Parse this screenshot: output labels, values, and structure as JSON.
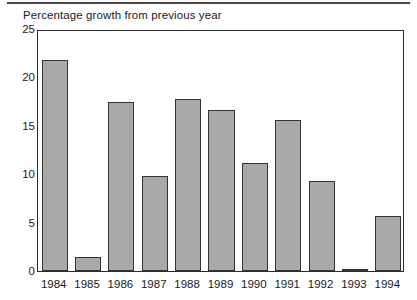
{
  "chart_data": {
    "type": "bar",
    "title": "Percentage growth from previous year",
    "xlabel": "",
    "ylabel": "",
    "categories": [
      "1984",
      "1985",
      "1986",
      "1987",
      "1988",
      "1989",
      "1990",
      "1991",
      "1992",
      "1993",
      "1994"
    ],
    "values": [
      21.8,
      1.4,
      17.5,
      9.8,
      17.8,
      16.6,
      11.2,
      15.6,
      9.3,
      0.2,
      5.7
    ],
    "ylim": [
      0,
      25
    ],
    "yticks": [
      0,
      5,
      10,
      15,
      20,
      25
    ],
    "ytick_labels": [
      "0",
      "5",
      "10",
      "15",
      "20",
      "25"
    ],
    "grid": false,
    "legend": null,
    "bar_fill_color": "#a9a9a9",
    "bar_edge_color": "#333333",
    "axis_color": "#2b2b2b",
    "background_color": "#ffffff"
  }
}
